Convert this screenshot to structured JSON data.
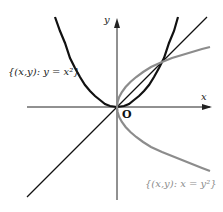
{
  "figure": {
    "labels": {
      "x_axis": "x",
      "y_axis": "y",
      "origin": "O",
      "parabola_set": "{(x,y): y = x²}",
      "sideways_parabola_set": "{(x,y): x = y²}"
    },
    "curves": [
      {
        "name": "y = x^2",
        "color": "#111111"
      },
      {
        "name": "x = y^2 (y ≥ ... both branches)",
        "color": "#8c8c8c"
      },
      {
        "name": "y = x",
        "color": "#111111"
      }
    ],
    "colors": {
      "parabola": "#111111",
      "sideways_parabola": "#8c8c8c",
      "line": "#111111",
      "axes": "#222222"
    }
  }
}
